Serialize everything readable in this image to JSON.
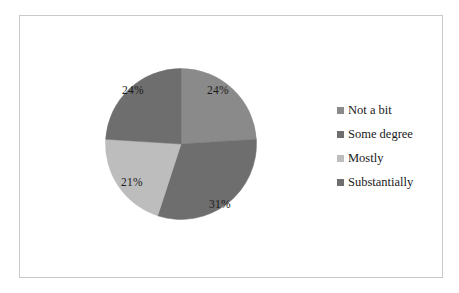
{
  "chart_data": {
    "type": "pie",
    "title": "",
    "categories": [
      "Not a bit",
      "Some degree",
      "Mostly",
      "Substantially"
    ],
    "values": [
      24,
      31,
      21,
      24
    ],
    "value_labels": [
      "24%",
      "31%",
      "21%",
      "24%"
    ],
    "units": "percent",
    "start_angle_deg": 0,
    "direction": "clockwise",
    "legend_position": "right",
    "grid": false,
    "colors": [
      "#8a8a8a",
      "#6e6e6e",
      "#bdbdbd",
      "#6e6e6e"
    ],
    "slices": [
      {
        "label": "Not a bit",
        "value": 24,
        "value_label": "24%",
        "color": "#8a8a8a"
      },
      {
        "label": "Some degree",
        "value": 31,
        "value_label": "31%",
        "color": "#6e6e6e"
      },
      {
        "label": "Mostly",
        "value": 21,
        "value_label": "21%",
        "color": "#bdbdbd"
      },
      {
        "label": "Substantially",
        "value": 24,
        "value_label": "24%",
        "color": "#6e6e6e"
      }
    ]
  },
  "legend": {
    "items": [
      {
        "label": "Not a bit",
        "color": "#8a8a8a"
      },
      {
        "label": "Some degree",
        "color": "#6e6e6e"
      },
      {
        "label": "Mostly",
        "color": "#bdbdbd"
      },
      {
        "label": "Substantially",
        "color": "#6e6e6e"
      }
    ]
  },
  "frame": {
    "border_color": "#c9c9c9",
    "background": "#ffffff"
  }
}
